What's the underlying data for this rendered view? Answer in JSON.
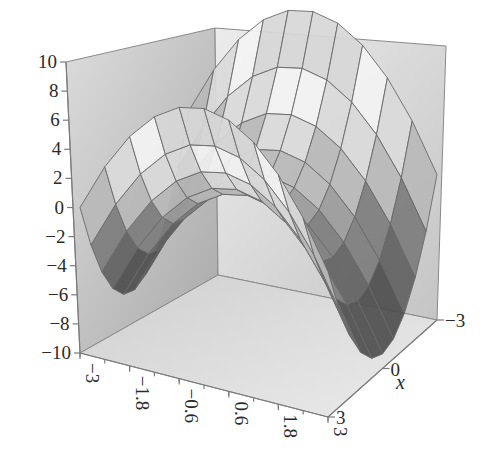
{
  "chart_data": {
    "type": "surface3d",
    "title": "",
    "function": "z = x^2 - y^2",
    "xlabel": "x",
    "ylabel": "",
    "zlabel": "",
    "x_range": [
      -3,
      3
    ],
    "y_range": [
      -3,
      3
    ],
    "z_range": [
      -10,
      10
    ],
    "grid_x": [
      -3,
      -2.4,
      -1.8,
      -1.2,
      -0.6,
      0,
      0.6,
      1.2,
      1.8,
      2.4,
      3
    ],
    "grid_y": [
      -3,
      -2.4,
      -1.8,
      -1.2,
      -0.6,
      0,
      0.6,
      1.2,
      1.8,
      2.4,
      3
    ],
    "z_ticks": [
      "10",
      "8",
      "6",
      "4",
      "2",
      "0",
      "−2",
      "−4",
      "−6",
      "−8",
      "−10"
    ],
    "z_tick_values": [
      10,
      8,
      6,
      4,
      2,
      0,
      -2,
      -4,
      -6,
      -8,
      -10
    ],
    "y_ticks": [
      "−3",
      "−1.8",
      "−0.6",
      "0.6",
      "1.8",
      "3"
    ],
    "y_tick_values": [
      -3,
      -1.8,
      -0.6,
      0.6,
      1.8,
      3
    ],
    "x_ticks": [
      "−3",
      "0",
      "3"
    ],
    "x_tick_values": [
      -3,
      0,
      3
    ],
    "shading": "grayscale contour bands",
    "band_colors": [
      "#3e3e3e",
      "#5a5a5a",
      "#727272",
      "#8c8c8c",
      "#a6a6a6",
      "#c2c2c2",
      "#dedede",
      "#f6f6f6",
      "#d4d4d4",
      "#a8a8a8"
    ],
    "grid": true,
    "box": true
  },
  "axes": {
    "x_title": "x"
  }
}
